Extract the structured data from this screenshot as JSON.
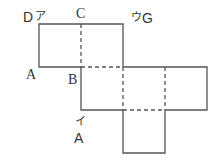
{
  "diagram": {
    "type": "cube-net",
    "square_size_px": 42,
    "line_color": "#555555",
    "labels": {
      "D": "D",
      "a_kana": "ア",
      "C": "C",
      "u_kana": "ウ",
      "G": "G",
      "A_left": "A",
      "B": "B",
      "i_kana": "イ",
      "A_bottom": "A"
    }
  }
}
